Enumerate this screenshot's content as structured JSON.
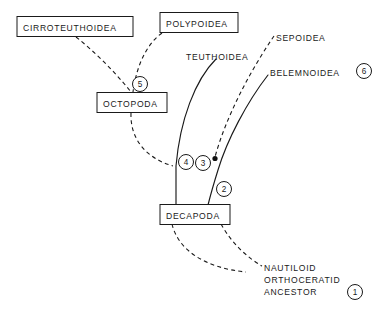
{
  "diagram": {
    "ink_color": "#1a1a1a",
    "background_color": "#ffffff"
  },
  "boxed_taxa": [
    {
      "id": "cirroteuthoidea",
      "label": "CIRROTEUTHOIDEA"
    },
    {
      "id": "polypoidea",
      "label": "POLYPOIDEA"
    },
    {
      "id": "octopoda",
      "label": "OCTOPODA"
    },
    {
      "id": "decapoda",
      "label": "DECAPODA"
    }
  ],
  "plain_taxa": [
    {
      "id": "teuthoidea",
      "label": "TEUTHOIDEA"
    },
    {
      "id": "sepoidea",
      "label": "SEPOIDEA"
    },
    {
      "id": "belemnoidea",
      "label": "BELEMNOIDEA"
    }
  ],
  "ancestor": {
    "line1": "NAUTILOID",
    "line2": "ORTHOCERATID",
    "line3": "ANCESTOR"
  },
  "nodes": [
    {
      "id": "node-1",
      "number": "1"
    },
    {
      "id": "node-2",
      "number": "2"
    },
    {
      "id": "node-3",
      "number": "3"
    },
    {
      "id": "node-4",
      "number": "4"
    },
    {
      "id": "node-5",
      "number": "5"
    },
    {
      "id": "node-6",
      "number": "6"
    }
  ]
}
